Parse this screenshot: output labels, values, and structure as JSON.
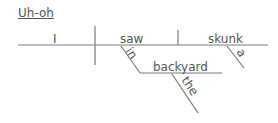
{
  "title": "Uh-oh",
  "diagram": {
    "subject": "I",
    "verb": "saw",
    "object": "skunk",
    "modifiers": {
      "preposition": "in",
      "prep_object": "backyard",
      "prep_object_article": "the",
      "object_article": "a"
    }
  },
  "colors": {
    "line": "#7a7a7a",
    "text": "#555555",
    "background": "#ffffff"
  }
}
